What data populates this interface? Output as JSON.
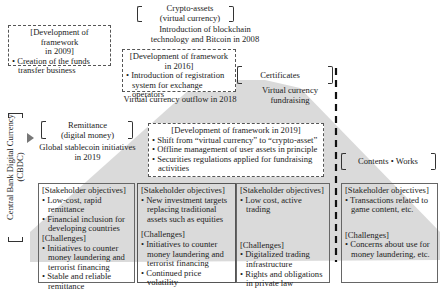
{
  "categories": {
    "crypto_assets": {
      "label_line1": "Crypto-assets",
      "label_line2": "(virtual currency)"
    },
    "certificates": {
      "label": "Certificates"
    },
    "remittance": {
      "label_line1": "Remittance",
      "label_line2": "(digital money)"
    },
    "contents_works": {
      "label": "Contents • Works"
    },
    "cbdc": {
      "label_line1": "Central Bank Digital Currency",
      "label_line2": "(CBDC)"
    }
  },
  "events": {
    "blockchain_2008": {
      "line1": "Introduction of blockchain",
      "line2": "technology and Bitcoin in 2008"
    },
    "outflow_2018": {
      "text": "Virtual currency outflow in 2018"
    },
    "fundraising": {
      "line1": "Virtual currency",
      "line2": "fundraising"
    },
    "stablecoin_2019": {
      "line1": "Global stablecoin initiatives",
      "line2": "in 2019"
    }
  },
  "frameworks": {
    "f2009": {
      "title_line1": "[Development of framework",
      "title_line2": "in 2009]",
      "items": [
        "• Creation of the funds transfer business"
      ]
    },
    "f2016": {
      "title_line1": "[Development of framework",
      "title_line2": "in 2016]",
      "items": [
        "• Introduction of registration system for exchange operators"
      ]
    },
    "f2019": {
      "title": "[Development of framework in 2019]",
      "items": [
        "• Shift from “virtual currency” to “crypto-asset”",
        "• Offline management of user assets in principle",
        "• Securities regulations applied for fundraising activities"
      ]
    }
  },
  "boxes": [
    {
      "objectives_title": "[Stakeholder objectives]",
      "objectives": [
        "• Low-cost, rapid remittance",
        "• Financial inclusion for developing countries"
      ],
      "challenges_title": "[Challenges]",
      "challenges": [
        "• Initiatives to counter money laundering and terrorist financing",
        "• Stable and reliable remittance"
      ]
    },
    {
      "objectives_title": "[Stakeholder objectives]",
      "objectives": [
        "• New investment targets replacing traditional assets such as equities"
      ],
      "challenges_title": "[Challenges]",
      "challenges": [
        "• Initiatives to counter money laundering and terrorist financing",
        "• Continued price volatility"
      ]
    },
    {
      "objectives_title": "[Stakeholder objectives]",
      "objectives": [
        "• Low cost, active trading"
      ],
      "challenges_title": "[Challenges]",
      "challenges": [
        "• Digitalized trading infrastructure",
        "• Rights and obligations in private law"
      ]
    },
    {
      "objectives_title": "[Stakeholder objectives]",
      "objectives": [
        "• Transactions related to game content, etc."
      ],
      "challenges_title": "[Challenges]",
      "challenges": [
        "• Concerns about use for money laundering, etc."
      ]
    }
  ],
  "colors": {
    "triangle_fill": "#d9d9d9",
    "border": "#666666",
    "text": "#222222"
  }
}
